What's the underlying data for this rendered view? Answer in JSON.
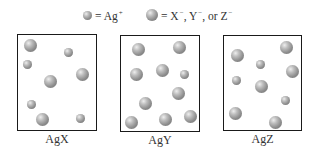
{
  "legend": {
    "small": {
      "label": "= Ag",
      "sup": "+",
      "meaning": "silver cation"
    },
    "large": {
      "label": "= X",
      "sup1": "−",
      "mid1": ", Y",
      "sup2": "−",
      "mid2": ", or Z",
      "sup3": "−",
      "meaning": "anion"
    }
  },
  "colors": {
    "border": "#1a1a1a",
    "sphere_light": "#eeeeee",
    "sphere_mid": "#8e8e8e",
    "sphere_dark": "#6a6a6a"
  },
  "panels": [
    {
      "label": "AgX",
      "box": {
        "left": 17,
        "top": 34,
        "right": 97,
        "bottom": 131
      },
      "spheres": [
        {
          "x": 30,
          "y": 45,
          "type": "large"
        },
        {
          "x": 68,
          "y": 52,
          "type": "small"
        },
        {
          "x": 27,
          "y": 64,
          "type": "small"
        },
        {
          "x": 82,
          "y": 74,
          "type": "large"
        },
        {
          "x": 50,
          "y": 81,
          "type": "large"
        },
        {
          "x": 31,
          "y": 104,
          "type": "small"
        },
        {
          "x": 42,
          "y": 119,
          "type": "large"
        },
        {
          "x": 80,
          "y": 118,
          "type": "small"
        }
      ]
    },
    {
      "label": "AgY",
      "box": {
        "left": 120,
        "top": 35,
        "right": 200,
        "bottom": 132
      },
      "spheres": [
        {
          "x": 138,
          "y": 49,
          "type": "large"
        },
        {
          "x": 179,
          "y": 47,
          "type": "large"
        },
        {
          "x": 136,
          "y": 74,
          "type": "large"
        },
        {
          "x": 162,
          "y": 70,
          "type": "large"
        },
        {
          "x": 184,
          "y": 74,
          "type": "small"
        },
        {
          "x": 178,
          "y": 93,
          "type": "large"
        },
        {
          "x": 145,
          "y": 103,
          "type": "large"
        },
        {
          "x": 131,
          "y": 122,
          "type": "large"
        },
        {
          "x": 165,
          "y": 119,
          "type": "large"
        },
        {
          "x": 190,
          "y": 116,
          "type": "large"
        }
      ]
    },
    {
      "label": "AgZ",
      "box": {
        "left": 223,
        "top": 35,
        "right": 302,
        "bottom": 131
      },
      "spheres": [
        {
          "x": 237,
          "y": 55,
          "type": "large"
        },
        {
          "x": 286,
          "y": 47,
          "type": "large"
        },
        {
          "x": 260,
          "y": 64,
          "type": "small"
        },
        {
          "x": 292,
          "y": 71,
          "type": "large"
        },
        {
          "x": 236,
          "y": 80,
          "type": "small"
        },
        {
          "x": 261,
          "y": 86,
          "type": "large"
        },
        {
          "x": 285,
          "y": 100,
          "type": "small"
        },
        {
          "x": 235,
          "y": 113,
          "type": "large"
        },
        {
          "x": 275,
          "y": 122,
          "type": "large"
        }
      ]
    }
  ]
}
